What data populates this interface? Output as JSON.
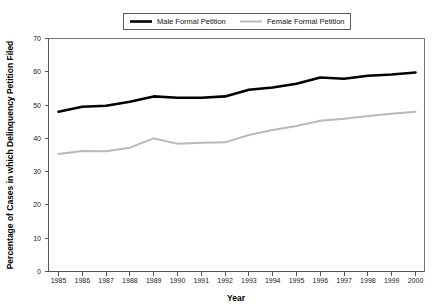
{
  "chart_data": {
    "type": "line",
    "title": "",
    "xlabel": "Year",
    "ylabel": "Percentage of Cases in which Delinquency Petition Filed",
    "x": [
      1985,
      1986,
      1987,
      1988,
      1989,
      1990,
      1991,
      1992,
      1993,
      1994,
      1995,
      1996,
      1997,
      1998,
      1999,
      2000
    ],
    "xtick_labels": [
      "1985",
      "1986",
      "1987",
      "1988",
      "1989",
      "1990",
      "1991",
      "1992",
      "1993",
      "1994",
      "1995",
      "1996",
      "1997",
      "1998",
      "1999",
      "2000"
    ],
    "ytick_labels": [
      "0",
      "10",
      "20",
      "30",
      "40",
      "50",
      "60",
      "70"
    ],
    "ytick_values": [
      0,
      10,
      20,
      30,
      40,
      50,
      60,
      70
    ],
    "ylim": [
      0,
      70
    ],
    "xlim": [
      1985,
      2000
    ],
    "grid": false,
    "legend_position": "top-center",
    "series": [
      {
        "name": "Male Formal Petition",
        "color": "#000000",
        "values": [
          48.0,
          49.5,
          49.8,
          51.0,
          52.6,
          52.2,
          52.2,
          52.6,
          54.6,
          55.3,
          56.4,
          58.3,
          57.9,
          58.8,
          59.2,
          59.8
        ]
      },
      {
        "name": "Female Formal Petition",
        "color": "#b9b9b9",
        "values": [
          35.3,
          36.2,
          36.1,
          37.2,
          40.0,
          38.4,
          38.7,
          38.8,
          41.0,
          42.5,
          43.7,
          45.3,
          45.9,
          46.7,
          47.4,
          48.0
        ]
      }
    ]
  },
  "legend": {
    "items": [
      {
        "label": "Male Formal Petition"
      },
      {
        "label": "Female Formal Petition"
      }
    ]
  },
  "axes": {
    "x_title": "Year",
    "y_title": "Percentage of Cases in which Delinquency Petition Filed"
  }
}
